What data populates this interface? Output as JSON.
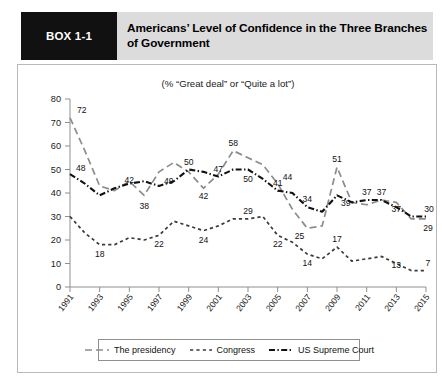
{
  "header": {
    "box_label": "BOX 1-1",
    "title": "Americans’ Level of Confidence in the Three Branches of Government"
  },
  "chart_data": {
    "type": "line",
    "title": "Americans’ Level of Confidence in the Three Branches of Government",
    "subtitle": "(% “Great deal” or “Quite a lot”)",
    "xlabel": "",
    "ylabel": "",
    "xlim": [
      1991,
      2015
    ],
    "ylim": [
      0,
      80
    ],
    "ytick_step": 10,
    "yticks": [
      0,
      10,
      20,
      30,
      40,
      50,
      60,
      70,
      80
    ],
    "xticks": [
      1991,
      1993,
      1995,
      1997,
      1999,
      2001,
      2003,
      2005,
      2007,
      2009,
      2011,
      2013,
      2015
    ],
    "x": [
      1991,
      1992,
      1993,
      1994,
      1995,
      1996,
      1997,
      1998,
      1999,
      2000,
      2001,
      2002,
      2003,
      2004,
      2005,
      2006,
      2007,
      2008,
      2009,
      2010,
      2011,
      2012,
      2013,
      2014,
      2015
    ],
    "grid": false,
    "legend_position": "bottom",
    "series": [
      {
        "name": "The presidency",
        "color": "#8c8c8c",
        "style": "long-dash",
        "values": [
          72,
          58,
          43,
          41,
          45,
          39,
          49,
          53,
          49,
          42,
          48,
          58,
          55,
          52,
          44,
          33,
          25,
          26,
          51,
          36,
          35,
          37,
          36,
          29,
          29
        ],
        "labels": [
          {
            "year": 1991,
            "value": 72
          },
          {
            "year": 1996,
            "value": 38
          },
          {
            "year": 1997,
            "value": 49
          },
          {
            "year": 2000,
            "value": 42
          },
          {
            "year": 2002,
            "value": 58
          },
          {
            "year": 2005,
            "value": 44
          },
          {
            "year": 2007,
            "value": 25
          },
          {
            "year": 2009,
            "value": 51
          },
          {
            "year": 2012,
            "value": 37
          },
          {
            "year": 2015,
            "value": 29
          }
        ]
      },
      {
        "name": "Congress",
        "color": "#3a3a3a",
        "style": "short-dash",
        "values": [
          30,
          23,
          18,
          18,
          21,
          20,
          22,
          28,
          26,
          24,
          26,
          29,
          29,
          30,
          22,
          19,
          14,
          12,
          17,
          11,
          12,
          13,
          10,
          7,
          7
        ],
        "labels": [
          {
            "year": 1993,
            "value": 18
          },
          {
            "year": 1997,
            "value": 22
          },
          {
            "year": 2000,
            "value": 24
          },
          {
            "year": 2003,
            "value": 29
          },
          {
            "year": 2005,
            "value": 22
          },
          {
            "year": 2007,
            "value": 14
          },
          {
            "year": 2009,
            "value": 17
          },
          {
            "year": 2013,
            "value": 13
          },
          {
            "year": 2015,
            "value": 7
          }
        ]
      },
      {
        "name": "US Supreme Court",
        "color": "#111111",
        "style": "dash-dot",
        "values": [
          48,
          44,
          39,
          42,
          44,
          45,
          43,
          45,
          50,
          49,
          47,
          50,
          50,
          46,
          41,
          40,
          34,
          32,
          39,
          36,
          37,
          37,
          34,
          30,
          30
        ],
        "labels": [
          {
            "year": 1991,
            "value": 48
          },
          {
            "year": 1995,
            "value": 42
          },
          {
            "year": 1999,
            "value": 50
          },
          {
            "year": 2001,
            "value": 47
          },
          {
            "year": 2003,
            "value": 50
          },
          {
            "year": 2005,
            "value": 41
          },
          {
            "year": 2007,
            "value": 34
          },
          {
            "year": 2009,
            "value": 39
          },
          {
            "year": 2011,
            "value": 37
          },
          {
            "year": 2013,
            "value": 37
          },
          {
            "year": 2015,
            "value": 30
          }
        ]
      }
    ]
  },
  "legend": {
    "items": [
      {
        "label": "The presidency",
        "style": "long-dash",
        "color": "#8c8c8c"
      },
      {
        "label": "Congress",
        "style": "short-dash",
        "color": "#3a3a3a"
      },
      {
        "label": "US Supreme Court",
        "style": "dash-dot",
        "color": "#111111"
      }
    ]
  }
}
